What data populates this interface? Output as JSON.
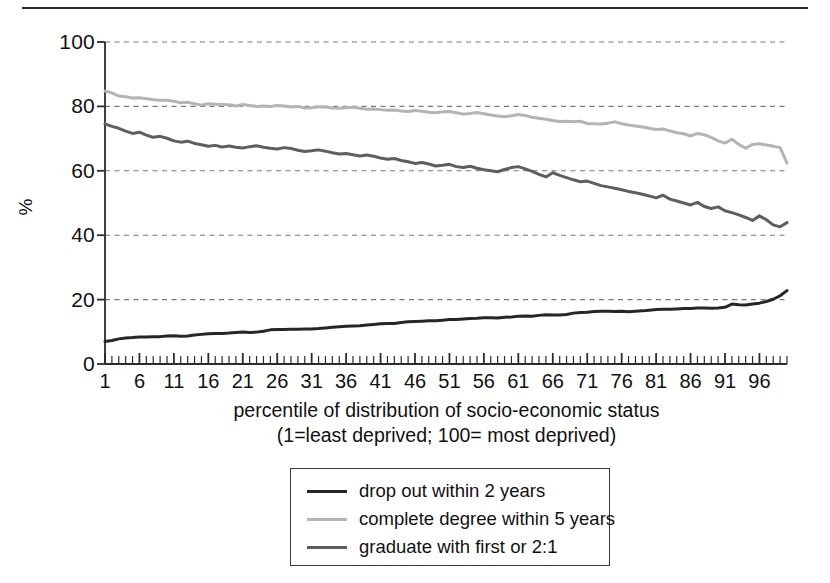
{
  "figure": {
    "top_rule": true
  },
  "chart_data": {
    "type": "line",
    "title": "",
    "xlabel": "percentile of distribution of socio-economic status",
    "xlabel_line2": "(1=least deprived; 100= most deprived)",
    "ylabel": "%",
    "xlim": [
      1,
      100
    ],
    "ylim": [
      0,
      100
    ],
    "grid": true,
    "grid_style": "dashed-horizontal",
    "legend_position": "below-center",
    "y_ticks": [
      0,
      20,
      40,
      60,
      80,
      100
    ],
    "x_ticks": [
      1,
      6,
      11,
      16,
      21,
      26,
      31,
      36,
      41,
      46,
      51,
      56,
      61,
      66,
      71,
      76,
      81,
      86,
      91,
      96
    ],
    "x_minor_tick_step": 1,
    "x": [
      1,
      2,
      3,
      4,
      5,
      6,
      7,
      8,
      9,
      10,
      11,
      12,
      13,
      14,
      15,
      16,
      17,
      18,
      19,
      20,
      21,
      22,
      23,
      24,
      25,
      26,
      27,
      28,
      29,
      30,
      31,
      32,
      33,
      34,
      35,
      36,
      37,
      38,
      39,
      40,
      41,
      42,
      43,
      44,
      45,
      46,
      47,
      48,
      49,
      50,
      51,
      52,
      53,
      54,
      55,
      56,
      57,
      58,
      59,
      60,
      61,
      62,
      63,
      64,
      65,
      66,
      67,
      68,
      69,
      70,
      71,
      72,
      73,
      74,
      75,
      76,
      77,
      78,
      79,
      80,
      81,
      82,
      83,
      84,
      85,
      86,
      87,
      88,
      89,
      90,
      91,
      92,
      93,
      94,
      95,
      96,
      97,
      98,
      99,
      100
    ],
    "series": [
      {
        "name": "drop out within 2 years",
        "color": "#262626",
        "width": 3.0,
        "values": [
          7.0,
          7.3,
          7.8,
          8.1,
          8.2,
          8.4,
          8.4,
          8.5,
          8.5,
          8.7,
          8.8,
          8.6,
          8.7,
          9.0,
          9.2,
          9.4,
          9.5,
          9.5,
          9.6,
          9.8,
          9.9,
          9.8,
          9.9,
          10.2,
          10.6,
          10.7,
          10.7,
          10.8,
          10.8,
          10.9,
          10.9,
          11.0,
          11.2,
          11.4,
          11.6,
          11.7,
          11.8,
          11.9,
          12.1,
          12.3,
          12.5,
          12.6,
          12.6,
          12.9,
          13.1,
          13.2,
          13.3,
          13.4,
          13.4,
          13.6,
          13.8,
          13.8,
          14.0,
          14.1,
          14.2,
          14.4,
          14.4,
          14.3,
          14.5,
          14.6,
          14.8,
          14.9,
          14.8,
          15.1,
          15.3,
          15.2,
          15.2,
          15.4,
          15.8,
          16.0,
          16.1,
          16.3,
          16.4,
          16.4,
          16.3,
          16.4,
          16.2,
          16.4,
          16.5,
          16.7,
          16.9,
          17.0,
          17.0,
          17.1,
          17.2,
          17.2,
          17.4,
          17.4,
          17.3,
          17.4,
          17.6,
          18.6,
          18.4,
          18.3,
          18.6,
          18.9,
          19.4,
          20.1,
          21.2,
          22.8
        ]
      },
      {
        "name": "complete degree within 5 years",
        "color": "#b4b4b4",
        "width": 3.0,
        "values": [
          84.8,
          84.2,
          83.2,
          83.0,
          82.6,
          82.7,
          82.4,
          82.1,
          81.9,
          81.9,
          81.6,
          81.1,
          81.3,
          80.8,
          80.4,
          80.8,
          80.7,
          80.6,
          80.5,
          80.1,
          80.6,
          80.3,
          80.0,
          80.1,
          80.0,
          80.3,
          80.1,
          79.8,
          80.0,
          79.5,
          79.6,
          79.9,
          79.8,
          79.5,
          79.4,
          79.6,
          79.7,
          79.4,
          79.1,
          79.2,
          79.0,
          78.8,
          78.9,
          78.6,
          78.4,
          78.7,
          78.5,
          78.2,
          78.0,
          78.3,
          78.4,
          78.0,
          77.6,
          77.8,
          78.1,
          77.7,
          77.3,
          77.0,
          76.8,
          77.1,
          77.5,
          77.2,
          76.6,
          76.3,
          76.0,
          75.6,
          75.3,
          75.4,
          75.2,
          75.4,
          74.7,
          74.6,
          74.5,
          74.8,
          75.2,
          74.6,
          74.2,
          73.9,
          73.6,
          73.2,
          72.8,
          73.0,
          72.4,
          71.8,
          71.5,
          70.8,
          71.6,
          71.2,
          70.4,
          69.3,
          68.6,
          69.8,
          68.2,
          67.0,
          68.2,
          68.4,
          68.0,
          67.6,
          67.2,
          62.4
        ]
      },
      {
        "name": "graduate with first or 2:1",
        "color": "#5e5e5e",
        "width": 3.0,
        "values": [
          74.6,
          73.8,
          73.2,
          72.3,
          71.6,
          72.0,
          71.1,
          70.4,
          70.7,
          70.1,
          69.3,
          68.9,
          69.2,
          68.5,
          68.1,
          67.6,
          67.9,
          67.4,
          67.7,
          67.3,
          67.1,
          67.5,
          67.8,
          67.3,
          67.0,
          66.8,
          67.2,
          66.9,
          66.4,
          66.0,
          66.2,
          66.5,
          66.1,
          65.6,
          65.2,
          65.4,
          65.0,
          64.6,
          64.9,
          64.5,
          64.0,
          63.6,
          63.8,
          63.2,
          62.8,
          62.3,
          62.6,
          62.1,
          61.5,
          61.7,
          62.0,
          61.3,
          61.0,
          61.4,
          60.8,
          60.3,
          60.0,
          59.7,
          60.4,
          61.0,
          61.3,
          60.6,
          59.8,
          58.9,
          58.1,
          59.4,
          58.6,
          57.9,
          57.2,
          56.6,
          56.8,
          56.1,
          55.4,
          55.0,
          54.6,
          54.1,
          53.6,
          53.2,
          52.7,
          52.2,
          51.6,
          52.4,
          51.2,
          50.6,
          50.0,
          49.4,
          50.2,
          48.9,
          48.3,
          48.8,
          47.6,
          47.0,
          46.3,
          45.5,
          44.6,
          46.0,
          44.8,
          43.2,
          42.6,
          43.9
        ]
      }
    ]
  },
  "legend": {
    "items": [
      {
        "label": "drop out within 2 years",
        "color": "#262626"
      },
      {
        "label": "complete degree within 5 years",
        "color": "#b4b4b4"
      },
      {
        "label": "graduate with first or 2:1",
        "color": "#5e5e5e"
      }
    ]
  }
}
